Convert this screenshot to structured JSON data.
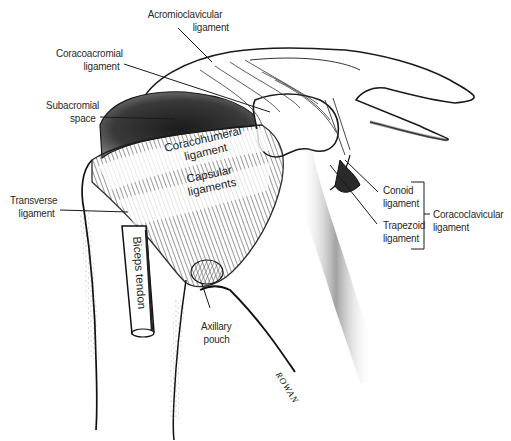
{
  "figure": {
    "line_color": "#1a1a1a",
    "shade_color": "#3a3a3a",
    "background": "#ffffff"
  },
  "labels": {
    "acromioclavicular": {
      "line1": "Acromioclavicular",
      "line2": "ligament"
    },
    "coracoacromial": {
      "line1": "Coracoacromial",
      "line2": "ligament"
    },
    "subacromial": {
      "line1": "Subacromial",
      "line2": "space"
    },
    "coracohumeral": {
      "line1": "Coracohumeral",
      "line2": "ligament"
    },
    "capsular": {
      "line1": "Capsular",
      "line2": "ligaments"
    },
    "transverse": {
      "line1": "Transverse",
      "line2": "ligament"
    },
    "biceps": {
      "text": "Biceps tendon"
    },
    "conoid": {
      "line1": "Conoid",
      "line2": "ligament"
    },
    "trapezoid": {
      "line1": "Trapezoid",
      "line2": "ligament"
    },
    "coracoclavicular": {
      "line1": "Coracoclavicular",
      "line2": "ligament"
    },
    "axillary": {
      "line1": "Axillary",
      "line2": "pouch"
    }
  },
  "signature": "ROWAN"
}
